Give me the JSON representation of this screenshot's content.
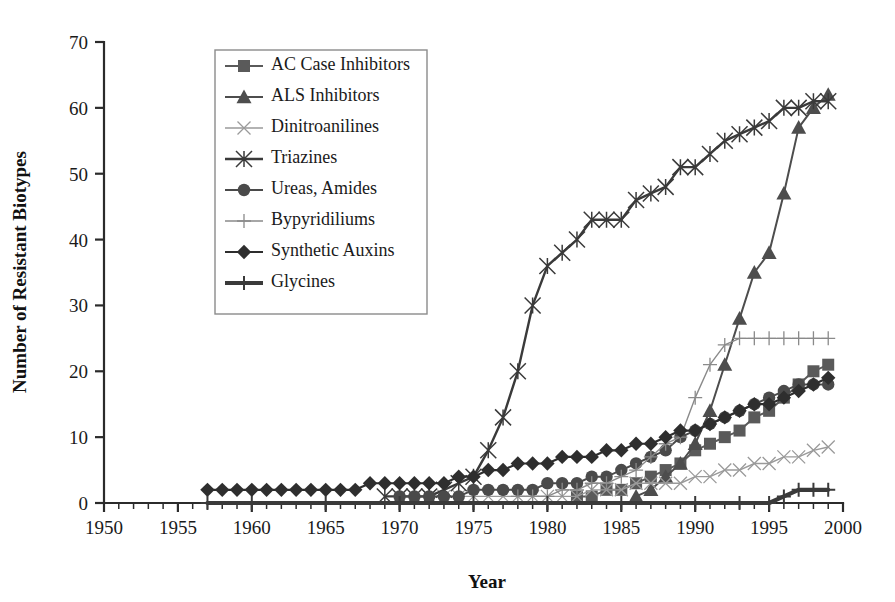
{
  "chart_data": {
    "type": "line",
    "title": "",
    "xlabel": "Year",
    "ylabel": "Number of Resistant Biotypes",
    "xlim": [
      1950,
      2000
    ],
    "ylim": [
      0,
      70
    ],
    "xticks": [
      1950,
      1955,
      1960,
      1965,
      1970,
      1975,
      1980,
      1985,
      1990,
      1995,
      2000
    ],
    "yticks": [
      0,
      10,
      20,
      30,
      40,
      50,
      60,
      70
    ],
    "minor_x_tick_interval": 1,
    "grid": false,
    "legend_position": "upper-left-inside",
    "series": [
      {
        "name": "AC Case Inhibitors",
        "marker": "square",
        "color": "#5a5a5a",
        "line_color": "#5a5a5a",
        "x": [
          1982,
          1983,
          1984,
          1985,
          1986,
          1987,
          1988,
          1989,
          1990,
          1991,
          1992,
          1993,
          1994,
          1995,
          1996,
          1997,
          1998,
          1999
        ],
        "y": [
          1,
          1,
          2,
          2,
          3,
          4,
          5,
          6,
          8,
          9,
          10,
          11,
          13,
          14,
          16,
          18,
          20,
          21
        ]
      },
      {
        "name": "ALS Inhibitors",
        "marker": "triangle",
        "color": "#4d4d4d",
        "line_color": "#4d4d4d",
        "x": [
          1986,
          1987,
          1988,
          1989,
          1990,
          1991,
          1992,
          1993,
          1994,
          1995,
          1996,
          1997,
          1998,
          1999
        ],
        "y": [
          1,
          2,
          4,
          6,
          9,
          14,
          21,
          28,
          35,
          38,
          47,
          57,
          60,
          62
        ]
      },
      {
        "name": "Dinitroanilines",
        "marker": "x-thin",
        "color": "#9a9a9a",
        "line_color": "#9a9a9a",
        "x": [
          1972,
          1973,
          1974,
          1975,
          1976,
          1977,
          1978,
          1979,
          1980,
          1981,
          1982,
          1983,
          1984,
          1985,
          1986,
          1987,
          1988,
          1989,
          1990,
          1991,
          1992,
          1993,
          1994,
          1995,
          1996,
          1997,
          1998,
          1999
        ],
        "y": [
          1,
          1,
          1,
          1,
          1,
          1,
          1,
          1,
          1,
          1,
          1,
          2,
          2,
          2,
          3,
          3,
          3,
          3,
          4,
          4,
          5,
          5,
          6,
          6,
          7,
          7,
          8,
          8.5
        ]
      },
      {
        "name": "Triazines",
        "marker": "asterisk",
        "color": "#3a3a3a",
        "line_color": "#3a3a3a",
        "x": [
          1969,
          1970,
          1971,
          1972,
          1973,
          1974,
          1975,
          1976,
          1977,
          1978,
          1979,
          1980,
          1981,
          1982,
          1983,
          1984,
          1985,
          1986,
          1987,
          1988,
          1989,
          1990,
          1991,
          1992,
          1993,
          1994,
          1995,
          1996,
          1997,
          1998,
          1999
        ],
        "y": [
          1,
          1,
          1,
          1,
          2,
          3,
          4,
          8,
          13,
          20,
          30,
          36,
          38,
          40,
          43,
          43,
          43,
          46,
          47,
          48,
          51,
          51,
          53,
          55,
          56,
          57,
          58,
          60,
          60,
          61,
          61
        ]
      },
      {
        "name": "Ureas, Amides",
        "marker": "circle",
        "color": "#4a4a4a",
        "line_color": "#4a4a4a",
        "x": [
          1970,
          1971,
          1972,
          1973,
          1974,
          1975,
          1976,
          1977,
          1978,
          1979,
          1980,
          1981,
          1982,
          1983,
          1984,
          1985,
          1986,
          1987,
          1988,
          1989,
          1990,
          1991,
          1992,
          1993,
          1994,
          1995,
          1996,
          1997,
          1998,
          1999
        ],
        "y": [
          1,
          1,
          1,
          1,
          1,
          2,
          2,
          2,
          2,
          2,
          3,
          3,
          3,
          4,
          4,
          5,
          6,
          7,
          8,
          10,
          11,
          12,
          13,
          14,
          15,
          16,
          17,
          18,
          18,
          18
        ]
      },
      {
        "name": "Bypyridiliums",
        "marker": "plus-thin",
        "color": "#8a8a8a",
        "line_color": "#8a8a8a",
        "x": [
          1978,
          1979,
          1980,
          1981,
          1982,
          1983,
          1984,
          1985,
          1986,
          1987,
          1988,
          1989,
          1990,
          1991,
          1992,
          1993,
          1994,
          1995,
          1996,
          1997,
          1998,
          1999
        ],
        "y": [
          1,
          1,
          1,
          2,
          2,
          3,
          3,
          4,
          5,
          7,
          9,
          10,
          16,
          21,
          24,
          25,
          25,
          25,
          25,
          25,
          25,
          25
        ]
      },
      {
        "name": "Synthetic Auxins",
        "marker": "diamond",
        "color": "#2e2e2e",
        "line_color": "#2e2e2e",
        "x": [
          1957,
          1958,
          1959,
          1960,
          1961,
          1962,
          1963,
          1964,
          1965,
          1966,
          1967,
          1968,
          1969,
          1970,
          1971,
          1972,
          1973,
          1974,
          1975,
          1976,
          1977,
          1978,
          1979,
          1980,
          1981,
          1982,
          1983,
          1984,
          1985,
          1986,
          1987,
          1988,
          1989,
          1990,
          1991,
          1992,
          1993,
          1994,
          1995,
          1996,
          1997,
          1998,
          1999
        ],
        "y": [
          2,
          2,
          2,
          2,
          2,
          2,
          2,
          2,
          2,
          2,
          2,
          3,
          3,
          3,
          3,
          3,
          3,
          4,
          4,
          5,
          5,
          6,
          6,
          6,
          7,
          7,
          7,
          8,
          8,
          9,
          9,
          10,
          11,
          11,
          12,
          13,
          14,
          15,
          15,
          16,
          17,
          18,
          19
        ]
      },
      {
        "name": "Glycines",
        "marker": "plus-bold",
        "color": "#3a3a3a",
        "line_color": "#3a3a3a",
        "x": [
          1957,
          1960,
          1965,
          1970,
          1975,
          1980,
          1985,
          1990,
          1993,
          1995,
          1996,
          1997,
          1998,
          1999
        ],
        "y": [
          0,
          0,
          0,
          0,
          0,
          0,
          0,
          0,
          0,
          0,
          1,
          2,
          2,
          2
        ]
      }
    ]
  },
  "legend": {
    "items": [
      {
        "label": "AC Case Inhibitors"
      },
      {
        "label": "ALS Inhibitors"
      },
      {
        "label": "Dinitroanilines"
      },
      {
        "label": "Triazines"
      },
      {
        "label": "Ureas, Amides"
      },
      {
        "label": "Bypyridiliums"
      },
      {
        "label": "Synthetic Auxins"
      },
      {
        "label": "Glycines"
      }
    ]
  }
}
